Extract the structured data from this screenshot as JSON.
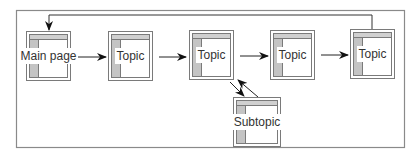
{
  "diagram": {
    "type": "site-navigation-flow",
    "nodes": [
      {
        "id": "main",
        "label": "Main page"
      },
      {
        "id": "topic1",
        "label": "Topic"
      },
      {
        "id": "topic2",
        "label": "Topic"
      },
      {
        "id": "topic3",
        "label": "Topic"
      },
      {
        "id": "topic4",
        "label": "Topic"
      },
      {
        "id": "subtopic",
        "label": "Subtopic"
      }
    ],
    "edges": [
      {
        "from": "main",
        "to": "topic1"
      },
      {
        "from": "topic1",
        "to": "topic2"
      },
      {
        "from": "topic2",
        "to": "topic3"
      },
      {
        "from": "topic3",
        "to": "topic4"
      },
      {
        "from": "topic4",
        "to": "main"
      },
      {
        "from": "topic2",
        "to": "subtopic"
      },
      {
        "from": "subtopic",
        "to": "topic2"
      }
    ],
    "colors": {
      "line": "#222222",
      "frame": "#8a8a8a",
      "sidebar": "#c4c4c4"
    }
  }
}
